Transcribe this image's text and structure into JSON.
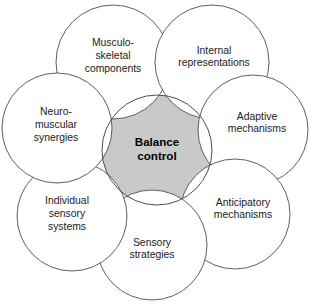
{
  "diagram": {
    "type": "venn-cluster",
    "canvas": {
      "width": 314,
      "height": 307
    },
    "colors": {
      "center_fill": "#c9c9c9",
      "outer_fill": "#ffffff",
      "stroke": "#4d4d4d",
      "text": "#1a1a1a",
      "center_text": "#000000",
      "background": "#ffffff"
    },
    "center": {
      "name": "balance-control",
      "lines": [
        "Balance",
        "control"
      ],
      "cx": 157,
      "cy": 150,
      "r": 55
    },
    "nodes": [
      {
        "name": "musculoskeletal-components",
        "lines": [
          "Musculo-",
          "skeletal",
          "components"
        ],
        "cx": 113,
        "cy": 62,
        "r": 57,
        "label_x": 113,
        "label_y": 56
      },
      {
        "name": "internal-representations",
        "lines": [
          "Internal",
          "representations"
        ],
        "cx": 212,
        "cy": 62,
        "r": 57,
        "label_x": 214,
        "label_y": 57
      },
      {
        "name": "adaptive-mechanisms",
        "lines": [
          "Adaptive",
          "mechanisms"
        ],
        "cx": 253,
        "cy": 130,
        "r": 55,
        "label_x": 257,
        "label_y": 123
      },
      {
        "name": "anticipatory-mechanisms",
        "lines": [
          "Anticipatory",
          "mechanisms"
        ],
        "cx": 235,
        "cy": 214,
        "r": 55,
        "label_x": 243,
        "label_y": 209
      },
      {
        "name": "sensory-strategies",
        "lines": [
          "Sensory",
          "strategies"
        ],
        "cx": 152,
        "cy": 245,
        "r": 55,
        "label_x": 152,
        "label_y": 249
      },
      {
        "name": "individual-sensory-systems",
        "lines": [
          "Individual",
          "sensory",
          "systems"
        ],
        "cx": 72,
        "cy": 216,
        "r": 55,
        "label_x": 67,
        "label_y": 214
      },
      {
        "name": "neuromuscular-synergies",
        "lines": [
          "Neuro-",
          "muscular",
          "synergies"
        ],
        "cx": 57,
        "cy": 128,
        "r": 55,
        "label_x": 56,
        "label_y": 125
      }
    ]
  }
}
